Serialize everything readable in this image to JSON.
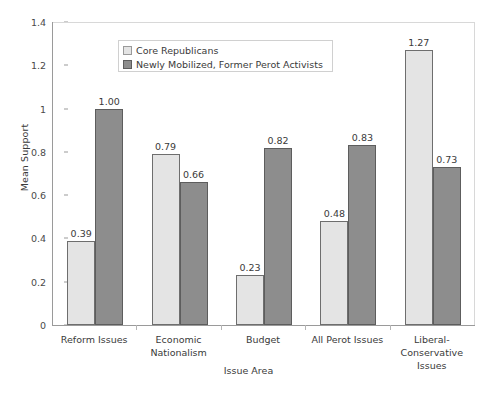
{
  "chart_data": {
    "type": "bar",
    "title": "",
    "xlabel": "Issue Area",
    "ylabel": "Mean Support",
    "ylim": [
      0,
      1.4
    ],
    "ytick_step": 0.2,
    "yticks": [
      "1.4",
      "1.2",
      "1",
      "0.8",
      "0.6",
      "0.4",
      "0.2",
      "0"
    ],
    "ytick_values": [
      1.4,
      1.2,
      1.0,
      0.8,
      0.6,
      0.4,
      0.2,
      0
    ],
    "grid": false,
    "legend_position": "top-left-inside",
    "categories": [
      "Reform Issues",
      "Economic Nationalism",
      "Budget",
      "All Perot Issues",
      "Liberal-Conservative Issues"
    ],
    "category_lines": [
      [
        "Reform Issues"
      ],
      [
        "Economic",
        "Nationalism"
      ],
      [
        "Budget"
      ],
      [
        "All Perot Issues"
      ],
      [
        "Liberal-",
        "Conservative",
        "Issues"
      ]
    ],
    "series": [
      {
        "name": "Core Republicans",
        "color": "#e4e4e4",
        "values": [
          0.39,
          0.79,
          0.23,
          0.48,
          1.27
        ],
        "labels": [
          "0.39",
          "0.79",
          "0.23",
          "0.48",
          "1.27"
        ]
      },
      {
        "name": "Newly Mobilized, Former Perot Activists",
        "color": "#8d8d8d",
        "values": [
          1.0,
          0.66,
          0.82,
          0.83,
          0.73
        ],
        "labels": [
          "1.00",
          "0.66",
          "0.82",
          "0.83",
          "0.73"
        ]
      }
    ]
  },
  "legend": {
    "items": [
      {
        "label": "Core Republicans",
        "swatch": "series-a"
      },
      {
        "label": "Newly Mobilized, Former Perot Activists",
        "swatch": "series-b"
      }
    ]
  },
  "colors": {
    "series_a": "#e4e4e4",
    "series_b": "#8d8d8d",
    "axis": "#9a9a9a",
    "text": "#3a3a3a",
    "background": "#ffffff"
  }
}
